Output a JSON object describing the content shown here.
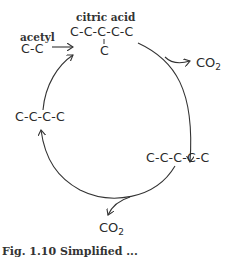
{
  "diagram": {
    "labels": {
      "acetyl": "acetyl",
      "acetyl_chain": "C-C",
      "citric_acid": "citric acid",
      "citric_chain": "C-C-C-C-C",
      "citric_branch": "C",
      "c5_chain": "C-C-C-C-C",
      "c4_chain": "C-C-C-C",
      "co2_top": "CO",
      "co2_top_sub": "2",
      "co2_bottom": "CO",
      "co2_bottom_sub": "2"
    },
    "caption": "Fig. 1.10  Simplified ..."
  }
}
